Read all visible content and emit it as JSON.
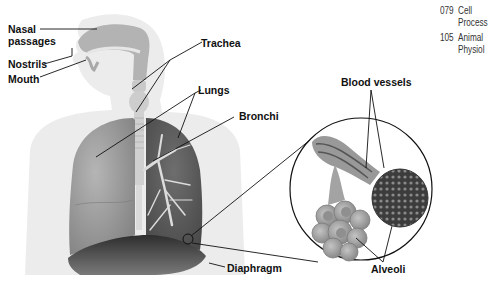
{
  "diagram": {
    "labels": {
      "nasal_passages": "Nasal\npassages",
      "nasal_line1": "Nasal",
      "nasal_line2": "passages",
      "nostrils": "Nostrils",
      "mouth": "Mouth",
      "trachea": "Trachea",
      "lungs": "Lungs",
      "bronchi": "Bronchi",
      "diaphragm": "Diaphragm",
      "blood_vessels": "Blood vessels",
      "alveoli": "Alveoli"
    },
    "cross_references": [
      {
        "number": "079",
        "line1": "Cell",
        "line2": "Process"
      },
      {
        "number": "105",
        "line1": "Animal",
        "line2": "Physiol"
      }
    ]
  },
  "colors": {
    "silhouette": "#ececec",
    "airway": "#b9b9b9",
    "lung_left": "#9a9a9a",
    "lung_right": "#5e5e5e",
    "bronchi": "#d8d8d8",
    "diaphragm": "#3a3a3a",
    "alveoli": "#a8a8a8",
    "blood_vessels": "#444444",
    "leader_line": "#111111"
  }
}
